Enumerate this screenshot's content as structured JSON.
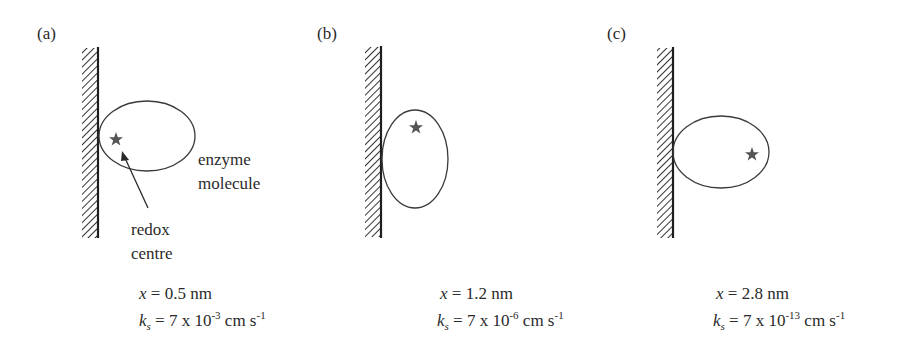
{
  "panels": [
    {
      "label": "(a)",
      "distance_var": "x",
      "distance_eq": "= 0.5 nm",
      "k_var": "k",
      "k_sub": "s",
      "k_eq": "= 7 x 10",
      "k_exp": "-3",
      "k_unit": " cm s",
      "k_unit_exp": "-1",
      "enzyme_label_line1": "enzyme",
      "enzyme_label_line2": "molecule",
      "redox_label_line1": "redox",
      "redox_label_line2": "centre"
    },
    {
      "label": "(b)",
      "distance_var": "x",
      "distance_eq": "= 1.2 nm",
      "k_var": "k",
      "k_sub": "s",
      "k_eq": "= 7 x 10",
      "k_exp": "-6",
      "k_unit": " cm s",
      "k_unit_exp": "-1"
    },
    {
      "label": "(c)",
      "distance_var": "x",
      "distance_eq": "= 2.8 nm",
      "k_var": "k",
      "k_sub": "s",
      "k_eq": "= 7 x 10",
      "k_exp": "-13",
      "k_unit": " cm s",
      "k_unit_exp": "-1"
    }
  ],
  "colors": {
    "line": "#2a2a2a",
    "star": "#555555",
    "background": "#ffffff"
  }
}
